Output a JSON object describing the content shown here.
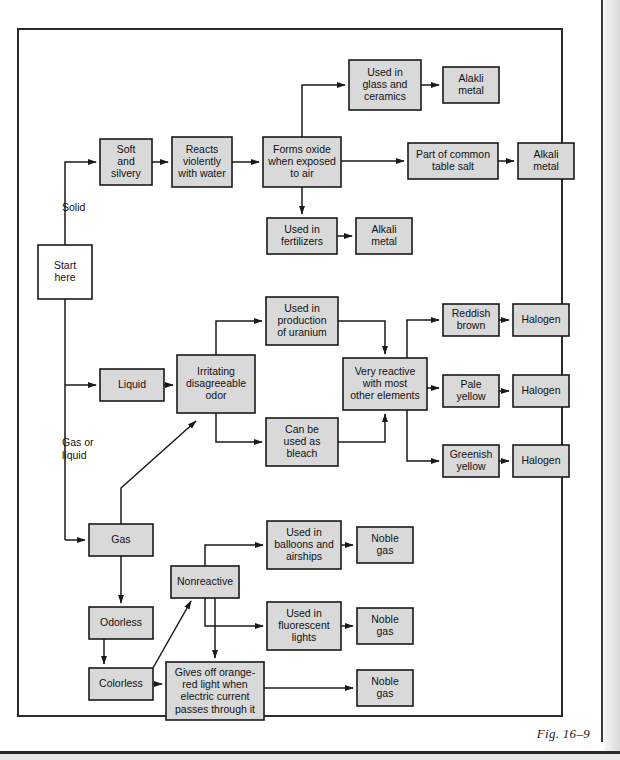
{
  "figure": {
    "caption": "Fig. 16–9",
    "type": "flowchart",
    "frame": {
      "x": 17,
      "y": 28,
      "width": 545,
      "height": 688
    }
  },
  "edge_labels": [
    {
      "id": "solid",
      "text": "Solid",
      "x": 62,
      "y": 211
    },
    {
      "id": "gas-or-liquid-1",
      "text": "Gas or",
      "x": 62,
      "y": 446
    },
    {
      "id": "gas-or-liquid-2",
      "text": "liquid",
      "x": 62,
      "y": 459
    }
  ],
  "nodes": [
    {
      "id": "start-here",
      "lines": [
        "Start",
        "here"
      ],
      "x": 38,
      "y": 245,
      "w": 54,
      "h": 54,
      "fill": "white"
    },
    {
      "id": "soft-and-silvery",
      "lines": [
        "Soft",
        "and",
        "silvery"
      ],
      "x": 100,
      "y": 139,
      "w": 52,
      "h": 46,
      "fill": "gray"
    },
    {
      "id": "reacts-violently",
      "lines": [
        "Reacts",
        "violently",
        "with water"
      ],
      "x": 172,
      "y": 137,
      "w": 60,
      "h": 50,
      "fill": "gray"
    },
    {
      "id": "forms-oxide",
      "lines": [
        "Forms oxide",
        "when exposed",
        "to air"
      ],
      "x": 263,
      "y": 137,
      "w": 78,
      "h": 50,
      "fill": "gray"
    },
    {
      "id": "used-glass-ceramics",
      "lines": [
        "Used in",
        "glass and",
        "ceramics"
      ],
      "x": 349,
      "y": 60,
      "w": 72,
      "h": 50,
      "fill": "gray"
    },
    {
      "id": "alakli-metal-1",
      "lines": [
        "Alakli",
        "metal"
      ],
      "x": 443,
      "y": 67,
      "w": 56,
      "h": 36,
      "fill": "gray"
    },
    {
      "id": "part-table-salt",
      "lines": [
        "Part of common",
        "table salt"
      ],
      "x": 408,
      "y": 143,
      "w": 90,
      "h": 36,
      "fill": "gray"
    },
    {
      "id": "alkali-metal-2",
      "lines": [
        "Alkali",
        "metal"
      ],
      "x": 518,
      "y": 143,
      "w": 56,
      "h": 36,
      "fill": "gray"
    },
    {
      "id": "used-fertilizers",
      "lines": [
        "Used in",
        "fertilizers"
      ],
      "x": 267,
      "y": 218,
      "w": 70,
      "h": 36,
      "fill": "gray"
    },
    {
      "id": "alkali-metal-3",
      "lines": [
        "Alkali",
        "metal"
      ],
      "x": 356,
      "y": 218,
      "w": 56,
      "h": 36,
      "fill": "gray"
    },
    {
      "id": "liquid",
      "lines": [
        "Liquid"
      ],
      "x": 100,
      "y": 369,
      "w": 64,
      "h": 32,
      "fill": "gray"
    },
    {
      "id": "irritating-odor",
      "lines": [
        "Irritating",
        "disagreeable",
        "odor"
      ],
      "x": 177,
      "y": 355,
      "w": 78,
      "h": 58,
      "fill": "gray"
    },
    {
      "id": "used-uranium",
      "lines": [
        "Used in",
        "production",
        "of uranium"
      ],
      "x": 266,
      "y": 297,
      "w": 72,
      "h": 48,
      "fill": "gray"
    },
    {
      "id": "can-be-bleach",
      "lines": [
        "Can be",
        "used as",
        "bleach"
      ],
      "x": 266,
      "y": 418,
      "w": 72,
      "h": 48,
      "fill": "gray"
    },
    {
      "id": "very-reactive",
      "lines": [
        "Very reactive",
        "with most",
        "other elements"
      ],
      "x": 343,
      "y": 358,
      "w": 84,
      "h": 52,
      "fill": "gray"
    },
    {
      "id": "reddish-brown",
      "lines": [
        "Reddish",
        "brown"
      ],
      "x": 443,
      "y": 304,
      "w": 56,
      "h": 32,
      "fill": "gray"
    },
    {
      "id": "halogen-1",
      "lines": [
        "Halogen"
      ],
      "x": 513,
      "y": 304,
      "w": 56,
      "h": 32,
      "fill": "gray"
    },
    {
      "id": "pale-yellow",
      "lines": [
        "Pale",
        "yellow"
      ],
      "x": 443,
      "y": 375,
      "w": 56,
      "h": 32,
      "fill": "gray"
    },
    {
      "id": "halogen-2",
      "lines": [
        "Halogen"
      ],
      "x": 513,
      "y": 375,
      "w": 56,
      "h": 32,
      "fill": "gray"
    },
    {
      "id": "greenish-yellow",
      "lines": [
        "Greenish",
        "yellow"
      ],
      "x": 443,
      "y": 445,
      "w": 56,
      "h": 32,
      "fill": "gray"
    },
    {
      "id": "halogen-3",
      "lines": [
        "Halogen"
      ],
      "x": 513,
      "y": 445,
      "w": 56,
      "h": 32,
      "fill": "gray"
    },
    {
      "id": "gas",
      "lines": [
        "Gas"
      ],
      "x": 89,
      "y": 524,
      "w": 64,
      "h": 32,
      "fill": "gray"
    },
    {
      "id": "odorless",
      "lines": [
        "Odorless"
      ],
      "x": 89,
      "y": 607,
      "w": 64,
      "h": 32,
      "fill": "gray"
    },
    {
      "id": "colorless",
      "lines": [
        "Colorless"
      ],
      "x": 89,
      "y": 668,
      "w": 64,
      "h": 32,
      "fill": "gray"
    },
    {
      "id": "nonreactive",
      "lines": [
        "Nonreactive"
      ],
      "x": 171,
      "y": 566,
      "w": 68,
      "h": 32,
      "fill": "gray"
    },
    {
      "id": "used-balloons",
      "lines": [
        "Used in",
        "balloons and",
        "airships"
      ],
      "x": 267,
      "y": 521,
      "w": 74,
      "h": 48,
      "fill": "gray"
    },
    {
      "id": "noble-gas-1",
      "lines": [
        "Noble",
        "gas"
      ],
      "x": 357,
      "y": 527,
      "w": 56,
      "h": 36,
      "fill": "gray"
    },
    {
      "id": "used-fluorescent",
      "lines": [
        "Used in",
        "fluorescent",
        "lights"
      ],
      "x": 267,
      "y": 602,
      "w": 74,
      "h": 48,
      "fill": "gray"
    },
    {
      "id": "noble-gas-2",
      "lines": [
        "Noble",
        "gas"
      ],
      "x": 357,
      "y": 608,
      "w": 56,
      "h": 36,
      "fill": "gray"
    },
    {
      "id": "gives-off-orange-red",
      "lines": [
        "Gives off orange-",
        "red light when",
        "electric current",
        "passes through it"
      ],
      "x": 166,
      "y": 662,
      "w": 98,
      "h": 58,
      "fill": "gray"
    },
    {
      "id": "noble-gas-3",
      "lines": [
        "Noble",
        "gas"
      ],
      "x": 357,
      "y": 670,
      "w": 56,
      "h": 36,
      "fill": "gray"
    }
  ],
  "connections": [
    {
      "from": "start-here",
      "to": "soft-and-silvery",
      "label": "Solid"
    },
    {
      "from": "soft-and-silvery",
      "to": "reacts-violently",
      "label": ""
    },
    {
      "from": "reacts-violently",
      "to": "forms-oxide",
      "label": ""
    },
    {
      "from": "forms-oxide",
      "to": "used-glass-ceramics",
      "label": ""
    },
    {
      "from": "used-glass-ceramics",
      "to": "alakli-metal-1",
      "label": ""
    },
    {
      "from": "forms-oxide",
      "to": "part-table-salt",
      "label": ""
    },
    {
      "from": "part-table-salt",
      "to": "alkali-metal-2",
      "label": ""
    },
    {
      "from": "forms-oxide",
      "to": "used-fertilizers",
      "label": ""
    },
    {
      "from": "used-fertilizers",
      "to": "alkali-metal-3",
      "label": ""
    },
    {
      "from": "start-here",
      "to": "liquid",
      "label": "Gas or liquid"
    },
    {
      "from": "liquid",
      "to": "irritating-odor",
      "label": ""
    },
    {
      "from": "irritating-odor",
      "to": "used-uranium",
      "label": ""
    },
    {
      "from": "irritating-odor",
      "to": "can-be-bleach",
      "label": ""
    },
    {
      "from": "used-uranium",
      "to": "very-reactive",
      "label": ""
    },
    {
      "from": "can-be-bleach",
      "to": "very-reactive",
      "label": ""
    },
    {
      "from": "very-reactive",
      "to": "reddish-brown",
      "label": ""
    },
    {
      "from": "very-reactive",
      "to": "pale-yellow",
      "label": ""
    },
    {
      "from": "very-reactive",
      "to": "greenish-yellow",
      "label": ""
    },
    {
      "from": "reddish-brown",
      "to": "halogen-1",
      "label": ""
    },
    {
      "from": "pale-yellow",
      "to": "halogen-2",
      "label": ""
    },
    {
      "from": "greenish-yellow",
      "to": "halogen-3",
      "label": ""
    },
    {
      "from": "start-here",
      "to": "gas",
      "label": "Gas or liquid"
    },
    {
      "from": "gas",
      "to": "odorless",
      "label": ""
    },
    {
      "from": "odorless",
      "to": "colorless",
      "label": ""
    },
    {
      "from": "colorless",
      "to": "nonreactive",
      "label": ""
    },
    {
      "from": "colorless",
      "to": "gives-off-orange-red",
      "label": ""
    },
    {
      "from": "colorless",
      "to": "irritating-odor",
      "label": ""
    },
    {
      "from": "nonreactive",
      "to": "used-balloons",
      "label": ""
    },
    {
      "from": "nonreactive",
      "to": "used-fluorescent",
      "label": ""
    },
    {
      "from": "nonreactive",
      "to": "gives-off-orange-red",
      "label": ""
    },
    {
      "from": "used-balloons",
      "to": "noble-gas-1",
      "label": ""
    },
    {
      "from": "used-fluorescent",
      "to": "noble-gas-2",
      "label": ""
    },
    {
      "from": "gives-off-orange-red",
      "to": "noble-gas-3",
      "label": ""
    }
  ],
  "colors": {
    "box_fill": "#d9d9d9",
    "box_fill_white": "#ffffff",
    "stroke": "#1a1a1a",
    "frame": "#2b2b2b",
    "text": "#111111"
  }
}
